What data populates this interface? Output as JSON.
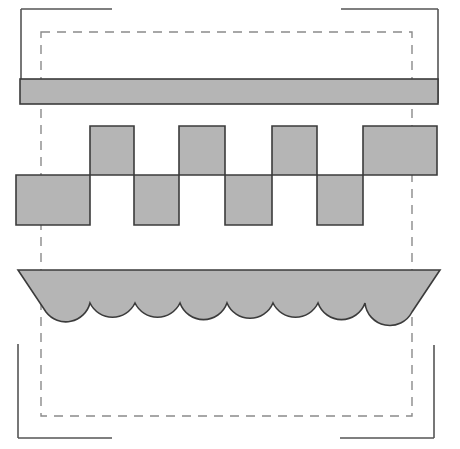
{
  "canvas": {
    "width": 460,
    "height": 449,
    "background": "#ffffff",
    "title": "Geometric Shape Diagram"
  },
  "colors": {
    "fill_gray": "#b5b5b5",
    "stroke_dark": "#3b3b3b",
    "stroke_bracket": "#555555",
    "dashed_stroke": "#8a8a8a",
    "background": "#ffffff"
  },
  "strokes": {
    "shape_width": 1.6,
    "bracket_width": 1.6,
    "dashed_width": 1.4,
    "dash_pattern": "9,7"
  },
  "chart_data": {
    "type": "diagram",
    "shapes": [
      {
        "name": "horizontal-bar",
        "kind": "rectangle",
        "x": 20,
        "y": 79,
        "width": 418,
        "height": 25,
        "fill": "#b5b5b5",
        "stroke": "#3b3b3b"
      },
      {
        "name": "square-wave",
        "kind": "polygon",
        "top_y": 126,
        "mid_y": 175,
        "bottom_y": 225,
        "start_x": 16,
        "end_x": 437,
        "transitions": [
          16,
          90,
          134,
          179,
          225,
          272,
          317,
          363,
          437
        ],
        "segments": [
          {
            "level": "low",
            "x0": 16,
            "x1": 90
          },
          {
            "level": "high",
            "x0": 90,
            "x1": 134
          },
          {
            "level": "low",
            "x0": 134,
            "x1": 179
          },
          {
            "level": "high",
            "x0": 179,
            "x1": 225
          },
          {
            "level": "low",
            "x0": 225,
            "x1": 272
          },
          {
            "level": "high",
            "x0": 272,
            "x1": 317
          },
          {
            "level": "low",
            "x0": 317,
            "x1": 363
          },
          {
            "level": "high",
            "x0": 363,
            "x1": 437
          }
        ],
        "fill": "#b5b5b5",
        "stroke": "#3b3b3b"
      },
      {
        "name": "scalloped-boat",
        "kind": "path",
        "top_y": 270,
        "left_tip_x": 18,
        "right_tip_x": 440,
        "scallop_count": 8,
        "scallop_start_x": 46,
        "scallop_end_x": 412,
        "cusp_y": 303,
        "arc_bottom_y": 318,
        "cusp_positions": [
          90,
          135,
          180,
          227,
          273,
          318,
          365
        ],
        "fill": "#b5b5b5",
        "stroke": "#3b3b3b"
      }
    ],
    "dashed_rectangle": {
      "name": "dashed-bounding-box",
      "x": 41,
      "y": 32,
      "width": 371,
      "height": 384,
      "stroke": "#8a8a8a",
      "dash": "9,7"
    },
    "corner_brackets": [
      {
        "name": "corner-bracket-top-left",
        "horizontal": {
          "x1": 21,
          "y1": 9,
          "x2": 112,
          "y2": 9
        },
        "vertical": {
          "x1": 21,
          "y1": 9,
          "x2": 21,
          "y2": 103
        }
      },
      {
        "name": "corner-bracket-top-right",
        "horizontal": {
          "x1": 341,
          "y1": 9,
          "x2": 438,
          "y2": 9
        },
        "vertical": {
          "x1": 438,
          "y1": 9,
          "x2": 438,
          "y2": 103
        }
      },
      {
        "name": "corner-bracket-bottom-left",
        "horizontal": {
          "x1": 18,
          "y1": 438,
          "x2": 112,
          "y2": 438
        },
        "vertical": {
          "x1": 18,
          "y1": 344,
          "x2": 18,
          "y2": 438
        }
      },
      {
        "name": "corner-bracket-bottom-right",
        "horizontal": {
          "x1": 340,
          "y1": 438,
          "x2": 434,
          "y2": 438
        },
        "vertical": {
          "x1": 434,
          "y1": 345,
          "x2": 434,
          "y2": 438
        }
      }
    ],
    "paths": {
      "square_wave_d": "M 16 175 L 16 225 L 90 225 L 90 126 L 134 126 L 134 225 L 179 225 L 179 126 L 225 126 L 225 225 L 272 225 L 272 126 L 317 126 L 317 225 L 363 225 L 363 126 L 437 126 L 437 175 Z",
      "boat_d": "M 18 270 L 440 270 L 412 312 A 22.9 22.9 0 0 1 365 303 A 22.9 22.9 0 0 1 318 303 A 22.9 22.9 0 0 1 273 303 A 22.9 22.9 0 0 1 227 303 A 22.9 22.9 0 0 1 180 303 A 22.9 22.9 0 0 1 135 303 A 22.9 22.9 0 0 1 90 303 A 22.9 22.9 0 0 1 46 312 Z"
    },
    "xlabel": "",
    "ylabel": "",
    "legend": []
  }
}
